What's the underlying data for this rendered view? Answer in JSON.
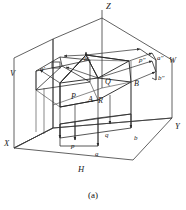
{
  "figure": {
    "caption": "(a)",
    "axes": [
      {
        "id": "axis-z",
        "label": "Z",
        "x": 106,
        "y": 2
      },
      {
        "id": "axis-x",
        "label": "X",
        "x": 4,
        "y": 139
      },
      {
        "id": "axis-y",
        "label": "Y",
        "x": 175,
        "y": 122
      }
    ],
    "planes": [
      {
        "id": "plane-v",
        "label": "V",
        "x": 10,
        "y": 69
      },
      {
        "id": "plane-h",
        "label": "H",
        "x": 78,
        "y": 165
      },
      {
        "id": "plane-w",
        "label": "W",
        "x": 169,
        "y": 56
      }
    ],
    "space_points": [
      {
        "id": "point-P",
        "label": "P",
        "x": 71,
        "y": 93
      },
      {
        "id": "point-A",
        "label": "A",
        "x": 88,
        "y": 96
      },
      {
        "id": "point-R",
        "label": "R",
        "x": 98,
        "y": 97
      },
      {
        "id": "point-Q",
        "label": "Q",
        "x": 105,
        "y": 78
      },
      {
        "id": "point-B",
        "label": "B",
        "x": 134,
        "y": 80
      }
    ],
    "v_projections": [
      {
        "id": "point-a-prime",
        "label": "a′",
        "x": 40,
        "y": 65
      },
      {
        "id": "point-b-prime",
        "label": "b′",
        "x": 84,
        "y": 55
      }
    ],
    "w_projections": [
      {
        "id": "point-p-double-prime",
        "label": "p″",
        "x": 139,
        "y": 56
      },
      {
        "id": "point-a-double-prime",
        "label": "a″",
        "x": 157,
        "y": 54
      },
      {
        "id": "point-b-double-prime",
        "label": "b″",
        "x": 158,
        "y": 74
      }
    ],
    "h_projections": [
      {
        "id": "point-p",
        "label": "p",
        "x": 71,
        "y": 142
      },
      {
        "id": "point-a",
        "label": "a",
        "x": 95,
        "y": 150
      },
      {
        "id": "point-q",
        "label": "q",
        "x": 105,
        "y": 131
      },
      {
        "id": "point-b",
        "label": "b",
        "x": 134,
        "y": 134
      }
    ],
    "colors": {
      "stroke": "#2b2b2b",
      "background": "#ffffff",
      "text": "#1a1a1a"
    },
    "geometry": {
      "frame_v_plane": "14,58 53,39 53,128 14,148",
      "frame_h_plane": "14,148 53,128 172,118 102,176",
      "frame_w_plane": "53,39 102,18 172,60 172,118",
      "axis_z_line": "102,18 102,10",
      "axis_origin": "53,128",
      "note": "trihedral projection box with house-shaped solid and projection rays"
    }
  }
}
